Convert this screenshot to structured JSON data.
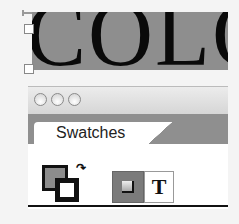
{
  "canvas": {
    "text": "COLO"
  },
  "panel": {
    "title": "Swatches",
    "window_buttons": [
      "close",
      "minimize",
      "zoom"
    ],
    "controls": {
      "swap_icon": "↷",
      "text_button_label": "T"
    }
  }
}
